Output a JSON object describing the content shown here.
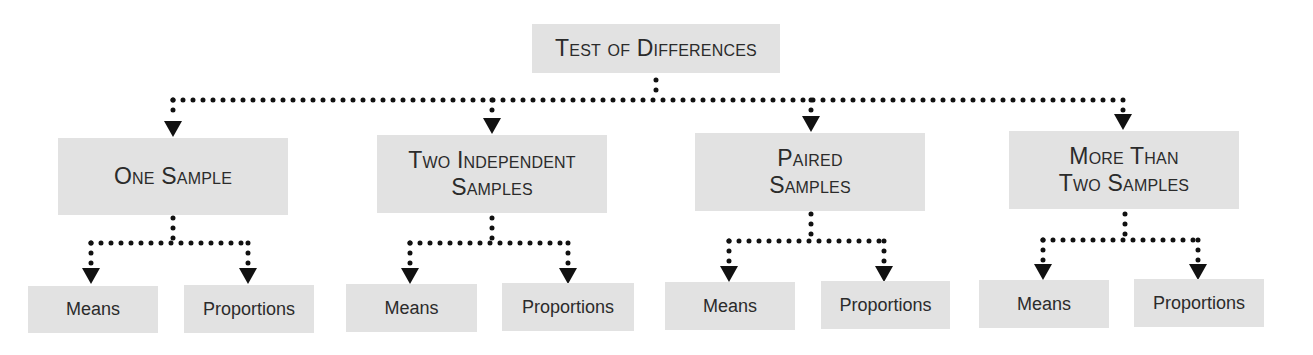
{
  "diagram": {
    "title": "Test of Differences",
    "categories": [
      {
        "label_line1": "One Sample",
        "label_line2": "",
        "children": [
          "Means",
          "Proportions"
        ]
      },
      {
        "label_line1": "Two Independent",
        "label_line2": "Samples",
        "children": [
          "Means",
          "Proportions"
        ]
      },
      {
        "label_line1": "Paired",
        "label_line2": "Samples",
        "children": [
          "Means",
          "Proportions"
        ]
      },
      {
        "label_line1": "More Than",
        "label_line2": "Two Samples",
        "children": [
          "Means",
          "Proportions"
        ]
      }
    ],
    "colors": {
      "box_fill": "#e2e2e2",
      "text": "#2b2b2b",
      "connector": "#111111"
    },
    "connector_style": "dotted-arrow"
  }
}
